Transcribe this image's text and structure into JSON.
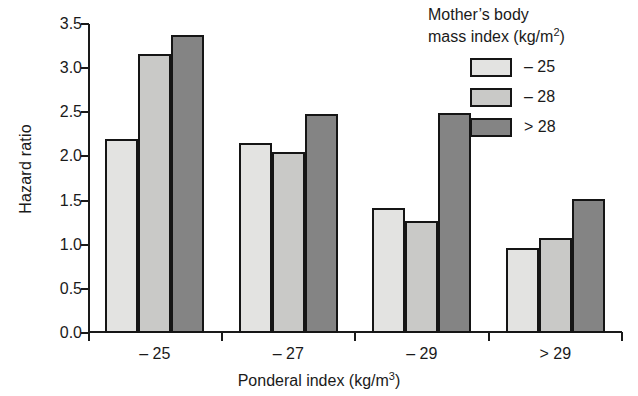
{
  "chart_data": {
    "type": "bar",
    "title": "",
    "xlabel": "Ponderal index (kg/m3)",
    "xlabel_base": "Ponderal index (kg/m",
    "xlabel_sup": "3",
    "xlabel_tail": ")",
    "ylabel": "Hazard ratio",
    "ylim": [
      0.0,
      3.5
    ],
    "ytick_labels": [
      "0.0",
      "0.5",
      "1.0",
      "1.5",
      "2.0",
      "2.5",
      "3.0",
      "3.5"
    ],
    "ytick_values": [
      0.0,
      0.5,
      1.0,
      1.5,
      2.0,
      2.5,
      3.0,
      3.5
    ],
    "grid": false,
    "legend_position": "top-right",
    "categories": [
      "– 25",
      "– 27",
      "– 29",
      "> 29"
    ],
    "series": [
      {
        "name": "– 25",
        "color": "#e3e3e1",
        "values": [
          2.2,
          2.15,
          1.42,
          0.96
        ]
      },
      {
        "name": "– 28",
        "color": "#c9c9c7",
        "values": [
          3.16,
          2.05,
          1.27,
          1.08
        ]
      },
      {
        "name": "> 28",
        "color": "#848484",
        "values": [
          3.37,
          2.48,
          2.49,
          1.52
        ]
      }
    ]
  },
  "legend": {
    "title_line1": "Mother’s body",
    "title_line2_base": "mass index (kg/m",
    "title_line2_sup": "2",
    "title_line2_tail": ")",
    "items": [
      {
        "label": "– 25",
        "color": "#e3e3e1"
      },
      {
        "label": "– 28",
        "color": "#c9c9c7"
      },
      {
        "label": "> 28",
        "color": "#848484"
      }
    ]
  }
}
